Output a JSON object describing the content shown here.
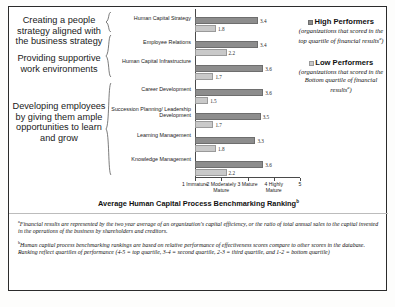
{
  "chart_data": {
    "type": "bar",
    "title": "",
    "xlabel": "Average Human Capital Process Benchmarking Ranking",
    "xlabel_sup": "b",
    "ylabel": "",
    "orientation": "horizontal",
    "xlim": [
      1,
      5
    ],
    "grid": false,
    "legend_position": "right",
    "xtick_values": [
      1,
      2,
      3,
      4,
      5
    ],
    "xtick_labels": [
      {
        "num": "1",
        "text": "Immature"
      },
      {
        "num": "2",
        "text": "Moderately Mature"
      },
      {
        "num": "3",
        "text": "Mature"
      },
      {
        "num": "4",
        "text": "Highly Mature"
      },
      {
        "num": "5",
        "text": ""
      }
    ],
    "categories": [
      "Human Capital Strategy",
      "Employee Relations",
      "Human Capital Infrastructure",
      "Career Development",
      "Succession Planning/ Leadership Development",
      "Learning Management",
      "Knowledge Management"
    ],
    "series": [
      {
        "name": "High Performers",
        "color": "#8d8d8d",
        "values": [
          3.4,
          3.4,
          3.6,
          3.6,
          3.5,
          3.3,
          3.6
        ]
      },
      {
        "name": "Low Performers",
        "color": "#c9c9c9",
        "values": [
          1.8,
          2.2,
          1.7,
          1.5,
          1.7,
          1.8,
          2.2
        ]
      }
    ]
  },
  "groups": [
    {
      "label": "Creating a people strategy aligned with the business strategy",
      "rows": 1
    },
    {
      "label": "Providing supportive work environments",
      "rows": 2
    },
    {
      "label": "Developing employees by giving them ample opportunities to learn and grow",
      "rows": 4
    }
  ],
  "legend": [
    {
      "title": "High Performers",
      "swatch_color": "#8d8d8d",
      "description": "(organizations that scored in the top quartile of financial results",
      "description_sup": "a",
      "description_tail": ")"
    },
    {
      "title": "Low Performers",
      "swatch_color": "#c9c9c9",
      "description": "(organizations that scored in the Bottom quartile of financial results",
      "description_sup": "a",
      "description_tail": ")"
    }
  ],
  "footnotes": [
    {
      "marker": "a",
      "text": "Financial results are represented by the two year average of an organization's capital efficiency, or the ratio of total annual sales to the capital invested in the operations of the business by shareholders and creditors."
    },
    {
      "marker": "b",
      "text": "Human capital process benchmarking rankings are based on relative performance of effectiveness scores compare to other scores in the database. Ranking reflect quartiles of performance (4-5 = top quartile, 3-4 = second quartile, 2-3 = third quartile, and 1-2 = bottom quartile)"
    }
  ]
}
